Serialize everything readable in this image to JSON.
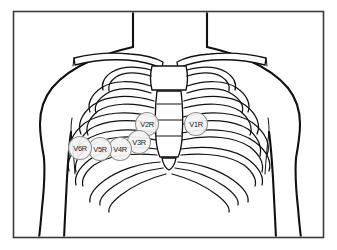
{
  "figure": {
    "border_color": "#3a3a3a",
    "line_color": "#111111",
    "background_color": "#ffffff",
    "electrode_fill_color": "#f4f4f4",
    "electrode_stroke_color": "#8f8f8f"
  },
  "electrodes": [
    {
      "label": "V1R",
      "cx": 196,
      "cy": 124,
      "r": 11.5
    },
    {
      "label": "V2R",
      "cx": 147,
      "cy": 124,
      "r": 11.5
    },
    {
      "label": "V3R",
      "cx": 139,
      "cy": 142,
      "r": 11.5
    },
    {
      "label": "V4R",
      "cx": 120,
      "cy": 149,
      "r": 11.5
    },
    {
      "label": "V5R",
      "cx": 100,
      "cy": 149,
      "r": 11.5
    },
    {
      "label": "V6R",
      "cx": 80,
      "cy": 148,
      "r": 11.5
    }
  ],
  "anatomy_labels": {
    "torso": "torso-outline",
    "neck": "neck-outline",
    "left_arm": "left-arm-outline",
    "right_arm": "right-arm-outline",
    "sternum_manubrium": "manubrium",
    "sternum_body": "sternum-body",
    "left_clavicle": "left-clavicle",
    "right_clavicle": "right-clavicle",
    "ribcage": "ribcage"
  }
}
